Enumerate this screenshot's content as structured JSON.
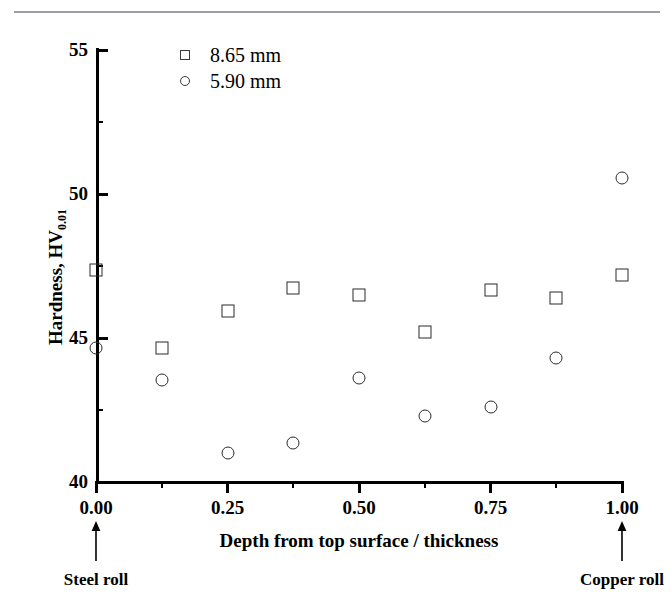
{
  "page": {
    "top_rule": "horizontal-rule"
  },
  "chart_data": {
    "type": "scatter",
    "title": "",
    "xlabel": "Depth from top surface / thickness",
    "ylabel": "Hardness, HV",
    "ylabel_subscript": "0.01",
    "xlim": [
      0.0,
      1.0
    ],
    "ylim": [
      40,
      55
    ],
    "xticks": [
      0.0,
      0.25,
      0.5,
      0.75,
      1.0
    ],
    "xtick_labels": [
      "0.00",
      "0.25",
      "0.50",
      "0.75",
      "1.00"
    ],
    "xminor_ticks": [
      0.125,
      0.375,
      0.625,
      0.875
    ],
    "yticks": [
      40,
      45,
      50,
      55
    ],
    "ytick_labels": [
      "40",
      "45",
      "50",
      "55"
    ],
    "yminor_ticks": [
      42.5,
      47.5,
      52.5
    ],
    "grid": false,
    "legend_position": "top-left-inside",
    "x": [
      0.0,
      0.125,
      0.25,
      0.375,
      0.5,
      0.625,
      0.75,
      0.875,
      1.0
    ],
    "series": [
      {
        "name": "8.65 mm",
        "marker": "square",
        "values": [
          47.35,
          44.65,
          45.95,
          46.75,
          46.5,
          45.2,
          46.65,
          46.4,
          47.2
        ]
      },
      {
        "name": "5.90 mm",
        "marker": "circle",
        "values": [
          44.65,
          43.55,
          41.0,
          41.35,
          43.6,
          42.3,
          42.6,
          44.3,
          50.55
        ]
      }
    ],
    "annotations": [
      {
        "text": "Steel roll",
        "x": 0.0,
        "arrow": "up"
      },
      {
        "text": "Copper roll",
        "x": 1.0,
        "arrow": "up"
      }
    ]
  },
  "legend": {
    "items": [
      {
        "label": "8.65 mm",
        "marker": "square"
      },
      {
        "label": "5.90 mm",
        "marker": "circle"
      }
    ]
  }
}
